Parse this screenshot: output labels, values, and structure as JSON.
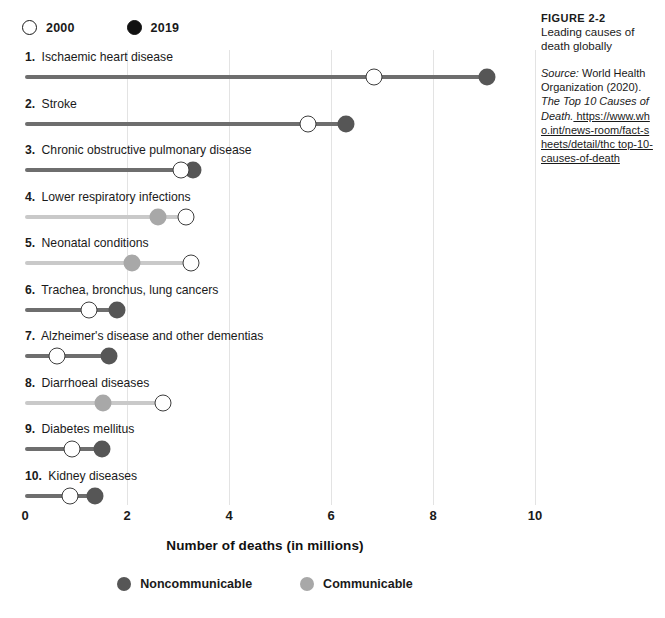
{
  "year_legend": {
    "items": [
      {
        "label": "2000",
        "style": "hollow"
      },
      {
        "label": "2019",
        "style": "solid"
      }
    ]
  },
  "category_legend": {
    "items": [
      {
        "label": "Noncommunicable",
        "key": "noncommunicable",
        "color": "#565656"
      },
      {
        "label": "Communicable",
        "key": "communicable",
        "color": "#a8a8a8"
      }
    ]
  },
  "caption": {
    "figure_number": "FIGURE 2-2",
    "title": "Leading causes of death globally",
    "source_prefix": "Source:",
    "source_org": " World Health Organization (2020). ",
    "source_work": "The Top 10 Causes of Death.",
    "source_url": " https://www.who.int/news-room/fact-sheets/detail/thc top-10-causes-of-death"
  },
  "chart_data": {
    "type": "bar",
    "subtype": "dumbbell",
    "title": "Leading causes of death globally",
    "xlabel": "Number of deaths (in millions)",
    "ylabel": "",
    "xlim": [
      0,
      10
    ],
    "xticks": [
      0,
      2,
      4,
      6,
      8,
      10
    ],
    "xtick_labels": [
      "0",
      "2",
      "4",
      "6",
      "8",
      "10"
    ],
    "grid": true,
    "grid_axis": "x",
    "legend_position": "top-left and bottom-center",
    "series": [
      {
        "name": "2000",
        "key": "v2000",
        "marker": "hollow-circle"
      },
      {
        "name": "2019",
        "key": "v2019",
        "marker": "filled-circle"
      }
    ],
    "categories": [
      "Ischaemic heart disease",
      "Stroke",
      "Chronic obstructive pulmonary disease",
      "Lower respiratory infections",
      "Neonatal conditions",
      "Trachea, bronchus, lung cancers",
      "Alzheimer's disease and other dementias",
      "Diarrhoeal diseases",
      "Diabetes mellitus",
      "Kidney diseases"
    ],
    "rows": [
      {
        "rank": "1.",
        "label": "Ischaemic heart disease",
        "v2000": 6.85,
        "v2019": 9.05,
        "category": "noncommunicable"
      },
      {
        "rank": "2.",
        "label": "Stroke",
        "v2000": 5.55,
        "v2019": 6.3,
        "category": "noncommunicable"
      },
      {
        "rank": "3.",
        "label": "Chronic obstructive pulmonary disease",
        "v2000": 3.05,
        "v2019": 3.3,
        "category": "noncommunicable"
      },
      {
        "rank": "4.",
        "label": "Lower respiratory infections",
        "v2000": 3.15,
        "v2019": 2.6,
        "category": "communicable"
      },
      {
        "rank": "5.",
        "label": "Neonatal conditions",
        "v2000": 3.25,
        "v2019": 2.1,
        "category": "communicable"
      },
      {
        "rank": "6.",
        "label": "Trachea, bronchus, lung cancers",
        "v2000": 1.25,
        "v2019": 1.8,
        "category": "noncommunicable"
      },
      {
        "rank": "7.",
        "label": "Alzheimer's disease and other dementias",
        "v2000": 0.63,
        "v2019": 1.65,
        "category": "noncommunicable"
      },
      {
        "rank": "8.",
        "label": "Diarrhoeal diseases",
        "v2000": 2.7,
        "v2019": 1.52,
        "category": "communicable"
      },
      {
        "rank": "9.",
        "label": "Diabetes mellitus",
        "v2000": 0.92,
        "v2019": 1.5,
        "category": "noncommunicable"
      },
      {
        "rank": "10.",
        "label": "Kidney diseases",
        "v2000": 0.88,
        "v2019": 1.37,
        "category": "noncommunicable"
      }
    ]
  }
}
